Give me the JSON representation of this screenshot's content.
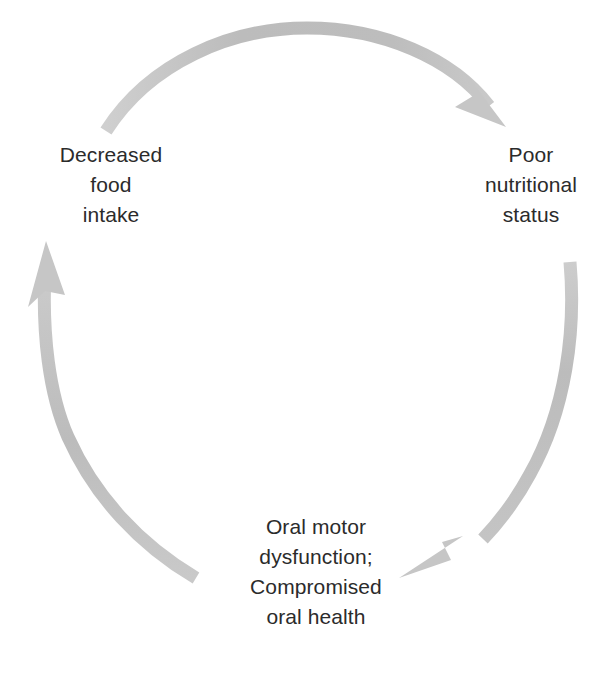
{
  "diagram": {
    "type": "cycle",
    "direction": "clockwise",
    "background_color": "#ffffff",
    "arrow_color": "#bdbdbd",
    "text_color": "#2b2b2b",
    "nodes": [
      {
        "id": "decreased-food-intake",
        "position": "top-left",
        "lines": [
          "Decreased",
          "food",
          "intake"
        ]
      },
      {
        "id": "poor-nutritional-status",
        "position": "top-right",
        "lines": [
          "Poor",
          "nutritional",
          "status"
        ]
      },
      {
        "id": "oral-motor-dysfunction",
        "position": "bottom",
        "lines": [
          "Oral motor",
          "dysfunction;",
          "Compromised",
          "oral health"
        ]
      }
    ],
    "arrows": [
      {
        "id": "arrow-top",
        "from": "decreased-food-intake",
        "to": "poor-nutritional-status",
        "shape": "arc",
        "icon": "curved-arrow-icon"
      },
      {
        "id": "arrow-right",
        "from": "poor-nutritional-status",
        "to": "oral-motor-dysfunction",
        "shape": "arc",
        "icon": "curved-arrow-icon"
      },
      {
        "id": "arrow-left",
        "from": "oral-motor-dysfunction",
        "to": "decreased-food-intake",
        "shape": "arc",
        "icon": "curved-arrow-icon"
      }
    ]
  }
}
